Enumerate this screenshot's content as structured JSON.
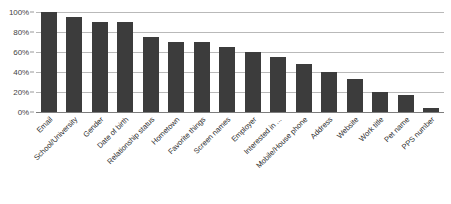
{
  "chart_data": {
    "type": "bar",
    "title": "",
    "subtitle": "",
    "xlabel": "",
    "ylabel": "",
    "ylim": [
      0,
      100
    ],
    "ytick_labels": [
      "100%",
      "80%",
      "60%",
      "40%",
      "20%",
      "0%"
    ],
    "ytick_values": [
      100,
      80,
      60,
      40,
      20,
      0
    ],
    "grid": true,
    "legend": false,
    "legend_position": "none",
    "bar_color": "#3c3c3c",
    "gridline_color": "#b9b9b9",
    "background_color": "#ffffff",
    "categories": [
      "Email",
      "School/University",
      "Gender",
      "Date of birth",
      "Relationship status",
      "Hometown",
      "Favorite things",
      "Screen names",
      "Employer",
      "Interested in ...",
      "Mobile/House phone",
      "Address",
      "Website",
      "Work title",
      "Pet name",
      "PPS number"
    ],
    "values": [
      100,
      95,
      90,
      90,
      75,
      70,
      70,
      65,
      60,
      55,
      48,
      40,
      33,
      20,
      17,
      4
    ]
  }
}
